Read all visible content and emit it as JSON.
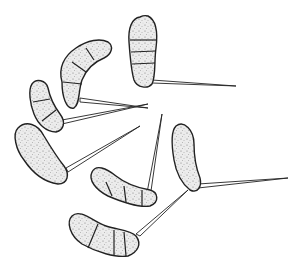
{
  "figure": {
    "style": "pen-and-ink stippled line drawing",
    "background_color": "#ffffff",
    "ink_color": "#222222",
    "conidia_count": 7,
    "conidia": [
      {
        "id": "top-right",
        "cells": 4,
        "appendage_direction": "right"
      },
      {
        "id": "upper-left-curved",
        "cells": 4,
        "appendage_direction": "right"
      },
      {
        "id": "left-small",
        "cells": 3,
        "appendage_direction": "right"
      },
      {
        "id": "left-large",
        "cells": 1,
        "appendage_direction": "upper-right"
      },
      {
        "id": "middle-curved",
        "cells": 4,
        "appendage_direction": "up"
      },
      {
        "id": "right-vertical",
        "cells": 1,
        "appendage_direction": "right"
      },
      {
        "id": "bottom-curved",
        "cells": 4,
        "appendage_direction": "upper-right"
      }
    ]
  }
}
